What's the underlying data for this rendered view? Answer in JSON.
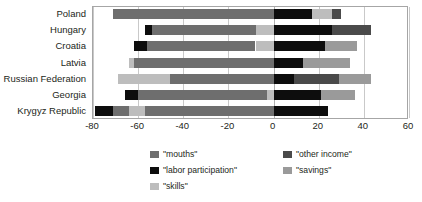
{
  "chart_data": {
    "type": "bar",
    "orientation": "horizontal",
    "stacked": true,
    "diverging": true,
    "title": "",
    "xlabel": "",
    "ylabel": "",
    "xlim": [
      -80,
      60
    ],
    "xticks": [
      -80,
      -60,
      -40,
      -20,
      0,
      20,
      40,
      60
    ],
    "grid": true,
    "legend_position": "bottom",
    "categories": [
      "Poland",
      "Hungary",
      "Croatia",
      "Latvia",
      "Russian Federation",
      "Georgia",
      "Krygyz Republic"
    ],
    "series": [
      {
        "name": "\"mouths\"",
        "color": "#6e6e6e",
        "values": [
          -71,
          -54,
          -50,
          -62,
          -46,
          -60,
          -64
        ]
      },
      {
        "name": "\"labor participation\"",
        "color": "#0d0d0d",
        "values": [
          17,
          26,
          23,
          13,
          9,
          21,
          24
        ]
      },
      {
        "name": "\"other income\"",
        "color": "#4a4a4a",
        "values": [
          3,
          17,
          0,
          1,
          20,
          0,
          0
        ]
      },
      {
        "name": "\"savings\"",
        "color": "#9a9a9a",
        "values": [
          9,
          0,
          14,
          16,
          14,
          15,
          0
        ]
      },
      {
        "name": "\"skills\"",
        "color": "#bdbdbd",
        "values": [
          0,
          -3,
          -6,
          -1,
          -23,
          -3,
          -7
        ]
      }
    ],
    "legend_entries": [
      {
        "label": "\"mouths\"",
        "color": "#6e6e6e"
      },
      {
        "label": "\"other income\"",
        "color": "#4a4a4a"
      },
      {
        "label": "\"labor participation\"",
        "color": "#0d0d0d"
      },
      {
        "label": "\"savings\"",
        "color": "#9a9a9a"
      },
      {
        "label": "\"skills\"",
        "color": "#bdbdbd"
      }
    ],
    "bars": [
      {
        "category": "Poland",
        "segments": [
          {
            "series": "\"mouths\"",
            "from": -71,
            "to": 0
          },
          {
            "series": "\"labor participation\"",
            "from": 0,
            "to": 17
          },
          {
            "series": "\"skills\"",
            "from": 17,
            "to": 26
          },
          {
            "series": "\"other income\"",
            "from": 26,
            "to": 30
          }
        ]
      },
      {
        "category": "Hungary",
        "segments": [
          {
            "series": "\"labor participation\"",
            "from": -57,
            "to": -54
          },
          {
            "series": "\"mouths\"",
            "from": -54,
            "to": -8
          },
          {
            "series": "\"skills\"",
            "from": -8,
            "to": 0
          },
          {
            "series": "\"labor participation\"",
            "from": 0,
            "to": 26
          },
          {
            "series": "\"other income\"",
            "from": 26,
            "to": 43
          }
        ]
      },
      {
        "category": "Croatia",
        "segments": [
          {
            "series": "\"labor participation\"",
            "from": -62,
            "to": -56
          },
          {
            "series": "\"mouths\"",
            "from": -56,
            "to": -8
          },
          {
            "series": "\"skills\"",
            "from": -8,
            "to": 0
          },
          {
            "series": "\"labor participation\"",
            "from": 0,
            "to": 23
          },
          {
            "series": "\"savings\"",
            "from": 23,
            "to": 37
          }
        ]
      },
      {
        "category": "Latvia",
        "segments": [
          {
            "series": "\"skills\"",
            "from": -64,
            "to": -62
          },
          {
            "series": "\"mouths\"",
            "from": -62,
            "to": 0
          },
          {
            "series": "\"labor participation\"",
            "from": 0,
            "to": 13
          },
          {
            "series": "\"savings\"",
            "from": 13,
            "to": 34
          }
        ]
      },
      {
        "category": "Russian Federation",
        "segments": [
          {
            "series": "\"skills\"",
            "from": -69,
            "to": -46
          },
          {
            "series": "\"mouths\"",
            "from": -46,
            "to": 0
          },
          {
            "series": "\"labor participation\"",
            "from": 0,
            "to": 9
          },
          {
            "series": "\"other income\"",
            "from": 9,
            "to": 29
          },
          {
            "series": "\"savings\"",
            "from": 29,
            "to": 43
          }
        ]
      },
      {
        "category": "Georgia",
        "segments": [
          {
            "series": "\"labor participation\"",
            "from": -66,
            "to": -60
          },
          {
            "series": "\"mouths\"",
            "from": -60,
            "to": -3
          },
          {
            "series": "\"skills\"",
            "from": -3,
            "to": 0
          },
          {
            "series": "\"labor participation\"",
            "from": 0,
            "to": 21
          },
          {
            "series": "\"savings\"",
            "from": 21,
            "to": 36
          }
        ]
      },
      {
        "category": "Krygyz Republic",
        "segments": [
          {
            "series": "\"labor participation\"",
            "from": -79,
            "to": -71
          },
          {
            "series": "\"mouths\"",
            "from": -71,
            "to": -64
          },
          {
            "series": "\"skills\"",
            "from": -64,
            "to": -57
          },
          {
            "series": "\"mouths\"",
            "from": -57,
            "to": 0
          },
          {
            "series": "\"labor participation\"",
            "from": 0,
            "to": 24
          }
        ]
      }
    ]
  }
}
